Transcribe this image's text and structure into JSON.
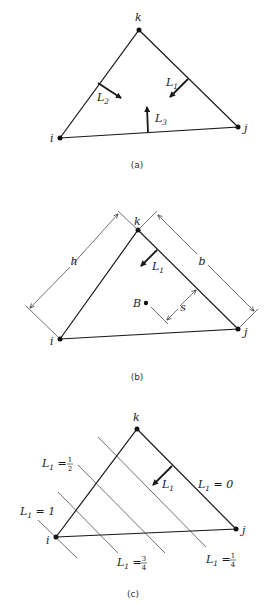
{
  "panels": [
    {
      "id": "a",
      "caption": "(a)",
      "vertices": {
        "i": "i",
        "j": "j",
        "k": "k"
      },
      "arrows": [
        {
          "label": "L",
          "sub": "1"
        },
        {
          "label": "L",
          "sub": "2"
        },
        {
          "label": "L",
          "sub": "3"
        }
      ]
    },
    {
      "id": "b",
      "caption": "(b)",
      "vertices": {
        "i": "i",
        "j": "j",
        "k": "k"
      },
      "arrow": {
        "label": "L",
        "sub": "1"
      },
      "dimensions": {
        "h": "h",
        "b": "b",
        "s": "s"
      },
      "point": "B"
    },
    {
      "id": "c",
      "caption": "(c)",
      "vertices": {
        "i": "i",
        "j": "j",
        "k": "k"
      },
      "arrow": {
        "label": "L",
        "sub": "1"
      },
      "contours": [
        {
          "label": "L",
          "sub": "1",
          "eq": " = 0"
        },
        {
          "label": "L",
          "sub": "1",
          "eq": " = ",
          "num": "1",
          "den": "4"
        },
        {
          "label": "L",
          "sub": "1",
          "eq": " = ",
          "num": "1",
          "den": "2"
        },
        {
          "label": "L",
          "sub": "1",
          "eq": " = ",
          "num": "3",
          "den": "4"
        },
        {
          "label": "L",
          "sub": "1",
          "eq": " = 1"
        }
      ]
    }
  ]
}
